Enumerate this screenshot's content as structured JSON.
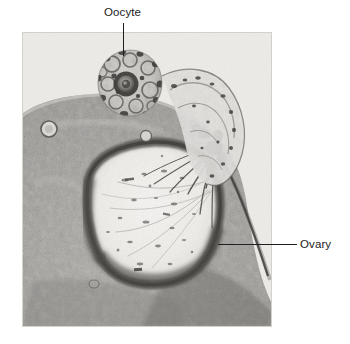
{
  "figure": {
    "type": "histological-micrograph",
    "stain_tone": "grayscale",
    "plate": {
      "x": 22,
      "y": 32,
      "width": 250,
      "height": 295,
      "background_color": "#e9e9e6"
    }
  },
  "annotations": [
    {
      "id": "oocyte",
      "label": "Oocyte",
      "text_x": 104,
      "text_y": 6,
      "leader": {
        "x": 123,
        "y": 23,
        "length": 33,
        "orientation": "vertical"
      },
      "points_to": "ovum within the cumulus mass at the top of the section"
    },
    {
      "id": "ovary",
      "label": "Ovary",
      "text_x": 300,
      "text_y": 238,
      "leader": {
        "x": 218,
        "y": 244,
        "length": 79,
        "orientation": "horizontal"
      },
      "points_to": "ovarian stroma and follicle wall at the right margin"
    }
  ],
  "colors": {
    "label_text": "#1b1b1b",
    "leader_line": "#1f1f1f",
    "page_background": "#ffffff",
    "plate_light": "#eceae6",
    "plate_mid": "#b3b1ac",
    "plate_dark": "#55534f",
    "plate_darkest": "#2c2b29",
    "antrum_light": "#f2f1ee"
  },
  "structures": [
    {
      "name": "oocyte",
      "description": "round cumulus-oophorus mass with dark central ovum, upper middle"
    },
    {
      "name": "antrum",
      "description": "large pale follicular cavity occupying the center"
    },
    {
      "name": "granulosa-layer",
      "description": "dark granular band lining the antrum"
    },
    {
      "name": "theca-stroma",
      "description": "speckled ovarian stroma filling the lower and left field"
    },
    {
      "name": "stigma",
      "description": "dark converging strands at the right shoulder of the follicle"
    },
    {
      "name": "extruded-mass",
      "description": "pale lobed mass arching over the top right of the follicle"
    }
  ]
}
